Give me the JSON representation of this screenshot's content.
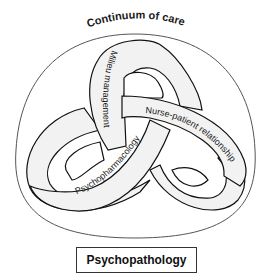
{
  "diagram": {
    "outer_label": "Continuum of care",
    "ribbons": [
      {
        "label": "Milieu management"
      },
      {
        "label": "Nurse-patient relationship"
      },
      {
        "label": "Psychopharmacology"
      }
    ],
    "base_label": "Psychopathology",
    "colors": {
      "ribbon_fill": "#f2f2f2",
      "stroke": "#111111",
      "outer_boundary": "#555555",
      "background": "#ffffff"
    }
  }
}
